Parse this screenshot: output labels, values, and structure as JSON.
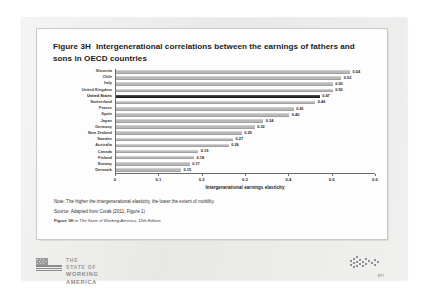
{
  "figure": {
    "number": "Figure 3H",
    "title": "Intergenerational correlations between the earnings of fathers and sons in OECD countries"
  },
  "notes": {
    "note": "Note: The higher the intergenerational elasticity, the lower the extent of mobility.",
    "source": "Source: Adapted from Corak (2011, Figure 1)",
    "citation_prefix": "Figure 3H",
    "citation_mid": " in ",
    "citation_italic": "The State of Working America, 12th Edition"
  },
  "footer": {
    "brand_line1": "THE STATE OF",
    "brand_line2": "WORKING AMERICA",
    "publisher": "EPI"
  },
  "chart_data": {
    "type": "bar",
    "orientation": "horizontal",
    "title": "Intergenerational correlations between the earnings of fathers and sons in OECD countries",
    "xlabel": "Intergenerational earnings elasticity",
    "ylabel": "",
    "xlim": [
      0,
      0.6
    ],
    "xticks": [
      "0",
      "0.1",
      "0.2",
      "0.3",
      "0.4",
      "0.5",
      "0.6"
    ],
    "xtick_values": [
      0,
      0.1,
      0.2,
      0.3,
      0.4,
      0.5,
      0.6
    ],
    "grid": false,
    "highlight": "United States",
    "bar_color": "#b9b9b9",
    "highlight_color": "#2e2e2e",
    "categories": [
      "Slovenia",
      "Chile",
      "Italy",
      "United Kingdom",
      "United States",
      "Switzerland",
      "France",
      "Spain",
      "Japan",
      "Germany",
      "New Zealand",
      "Sweden",
      "Australia",
      "Canada",
      "Finland",
      "Norway",
      "Denmark"
    ],
    "values": [
      0.54,
      0.52,
      0.5,
      0.5,
      0.47,
      0.46,
      0.41,
      0.4,
      0.34,
      0.32,
      0.29,
      0.27,
      0.26,
      0.19,
      0.18,
      0.17,
      0.15
    ],
    "labels": [
      "0.54",
      "0.52",
      "0.50",
      "0.50",
      "0.47",
      "0.46",
      "0.41",
      "0.40",
      "0.34",
      "0.32",
      "0.29",
      "0.27",
      "0.26",
      "0.19",
      "0.18",
      "0.17",
      "0.15"
    ]
  }
}
